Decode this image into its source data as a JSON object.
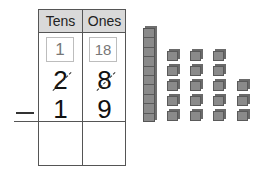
{
  "problem": {
    "operation": "subtraction",
    "operator_symbol": "−",
    "minuend": 28,
    "subtrahend": 19,
    "answer": ""
  },
  "table": {
    "headers": [
      "Tens",
      "Ones"
    ],
    "regroup": {
      "tens": "1",
      "ones": "18"
    },
    "top_row": {
      "tens": "2",
      "ones": "8",
      "crossed_out": true
    },
    "bottom_row": {
      "tens": "1",
      "ones": "9"
    },
    "answer_row": {
      "tens": "",
      "ones": ""
    }
  },
  "base_ten_blocks": {
    "tens_rods": 1,
    "unit_cubes": 18,
    "cube_columns": [
      5,
      5,
      5,
      3
    ]
  },
  "colors": {
    "header_bg": "#d9d9d9",
    "border": "#555555",
    "block": "#8a8a8a"
  }
}
